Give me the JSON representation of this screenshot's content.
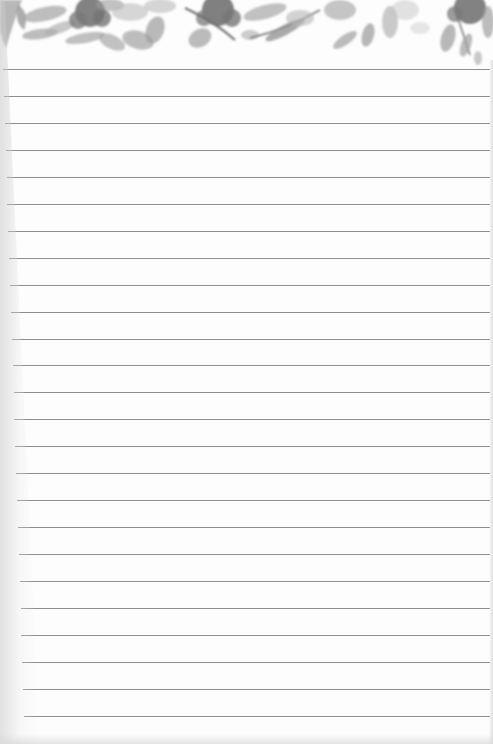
{
  "page": {
    "type": "lined-notepaper",
    "header_decoration": "watercolor-floral-border-grayscale",
    "line_count": 25,
    "line_color": "#8f8f8f",
    "paper_color": "#fdfdfd",
    "first_line_y": 69,
    "line_spacing": 26.95
  }
}
